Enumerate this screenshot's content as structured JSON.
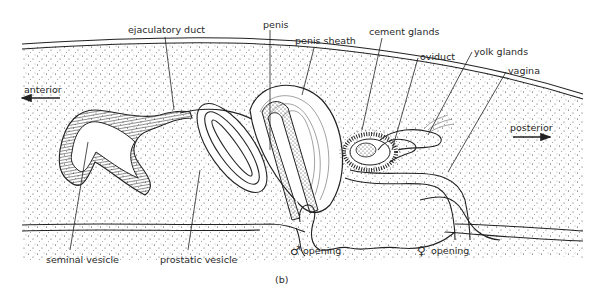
{
  "figure": {
    "caption": "(b)",
    "orientation": {
      "anterior_label": "anterior",
      "posterior_label": "posterior"
    },
    "labels": {
      "ejaculatory_duct": "ejaculatory duct",
      "penis": "penis",
      "penis_sheath": "penis sheath",
      "cement_glands": "cement glands",
      "oviduct": "oviduct",
      "yolk_glands": "yolk glands",
      "vagina": "vagina",
      "seminal_vesicle": "seminal vesicle",
      "prostatic_vesicle": "prostatic vesicle",
      "male_opening_symbol": "♂",
      "male_opening": "opening",
      "female_opening_symbol": "♀",
      "female_opening": "opening"
    }
  }
}
